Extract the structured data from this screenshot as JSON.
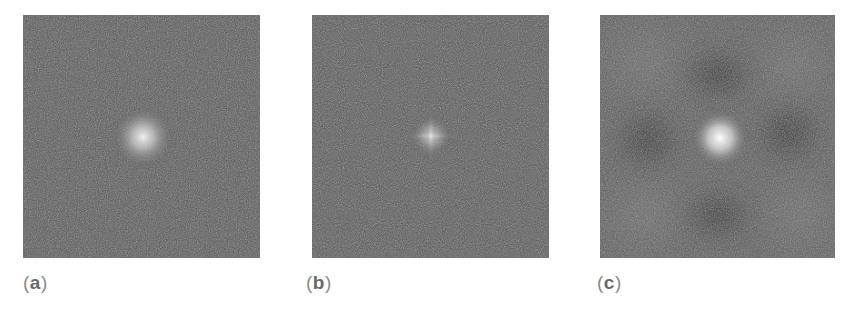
{
  "figure": {
    "background": "#ffffff",
    "panels": [
      {
        "id": "a",
        "label_open": "(",
        "label_letter": "a",
        "label_close": ")",
        "description": "Noisy gray field with diffuse round bright spot at center",
        "base_color": "#5a5a5a",
        "spot": {
          "x_pct": 50,
          "y_pct": 50,
          "radius_px": 30,
          "peak_color": "#e8e8e8"
        }
      },
      {
        "id": "b",
        "label_open": "(",
        "label_letter": "b",
        "label_close": ")",
        "description": "Noisy gray field with small cross-shaped bright spot at center",
        "base_color": "#5a5a5a",
        "spot": {
          "x_pct": 50,
          "y_pct": 50,
          "radius_px": 18,
          "peak_color": "#dcdcdc"
        }
      },
      {
        "id": "c",
        "label_open": "(",
        "label_letter": "c",
        "label_close": ")",
        "description": "Noisy gray field with bright center spot surrounded by four dark lobes",
        "base_color": "#5c5c5c",
        "spot": {
          "x_pct": 50,
          "y_pct": 50,
          "radius_px": 26,
          "peak_color": "#f2f2f2"
        }
      }
    ]
  }
}
